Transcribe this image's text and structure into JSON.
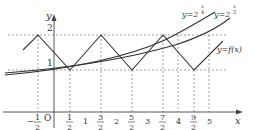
{
  "figure": {
    "axes": {
      "x_label": "x",
      "y_label": "y",
      "origin_label": "O"
    },
    "y_ticks": [
      {
        "value": 1,
        "label": "1"
      },
      {
        "value": 2,
        "label": "2"
      }
    ],
    "x_ticks": [
      {
        "value": -0.5,
        "label_num": "1",
        "label_den": "2",
        "sign": "−"
      },
      {
        "value": 0.5,
        "label_num": "1",
        "label_den": "2"
      },
      {
        "value": 1,
        "label": "1"
      },
      {
        "value": 1.5,
        "label_num": "3",
        "label_den": "2"
      },
      {
        "value": 2,
        "label": "2"
      },
      {
        "value": 2.5,
        "label_num": "5",
        "label_den": "2"
      },
      {
        "value": 3,
        "label": "3"
      },
      {
        "value": 3.5,
        "label_num": "7",
        "label_den": "2"
      },
      {
        "value": 4,
        "label": "4"
      },
      {
        "value": 4.5,
        "label_num": "9",
        "label_den": "2"
      },
      {
        "value": 5,
        "label": "5"
      }
    ],
    "curves": [
      {
        "name": "y=2^(x/4)",
        "label_base": "y=2",
        "label_exp_num": "x",
        "label_exp_den": "4"
      },
      {
        "name": "y=2^(x/5)",
        "label_base": "y=2",
        "label_exp_num": "x",
        "label_exp_den": "5"
      },
      {
        "name": "y=f(x)",
        "label": "y=f(x)",
        "type": "zigzag",
        "peaks_x": [
          -0.5,
          1.5,
          3.5
        ],
        "valleys_x": [
          0.5,
          2.5,
          4.5
        ],
        "peak_y": 2,
        "valley_y": 1
      }
    ]
  }
}
